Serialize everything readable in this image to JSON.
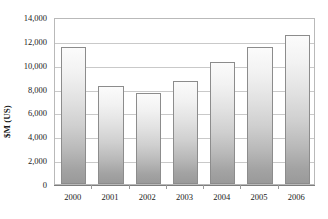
{
  "chart_data": {
    "type": "bar",
    "title": "",
    "xlabel": "",
    "ylabel": "$M (US)",
    "categories": [
      "2000",
      "2001",
      "2002",
      "2003",
      "2004",
      "2005",
      "2006"
    ],
    "values": [
      11500,
      8250,
      7600,
      8650,
      10250,
      11500,
      12500
    ],
    "ylim": [
      0,
      14000
    ],
    "ytick_values": [
      14000,
      12000,
      10000,
      8000,
      6000,
      4000,
      2000,
      0
    ],
    "ytick_labels": [
      "14,000",
      "12,000",
      "10,000",
      "8,000",
      "6,000",
      "4,000",
      "2,000",
      "0"
    ],
    "grid": true,
    "grid_axis": "y",
    "legend": false,
    "legend_position": "none",
    "series": [
      {
        "name": "",
        "values": [
          11500,
          8250,
          7600,
          8650,
          10250,
          11500,
          12500
        ]
      }
    ]
  },
  "style": {
    "bar_fill_top": "#fbfbfb",
    "bar_fill_bottom": "#9a9a9a",
    "bar_border": "#8c8c8c",
    "gridline_color": "#c9c9c9",
    "frame_color": "#b9b9b9",
    "text_color": "#1a1a1a",
    "background": "#ffffff"
  }
}
